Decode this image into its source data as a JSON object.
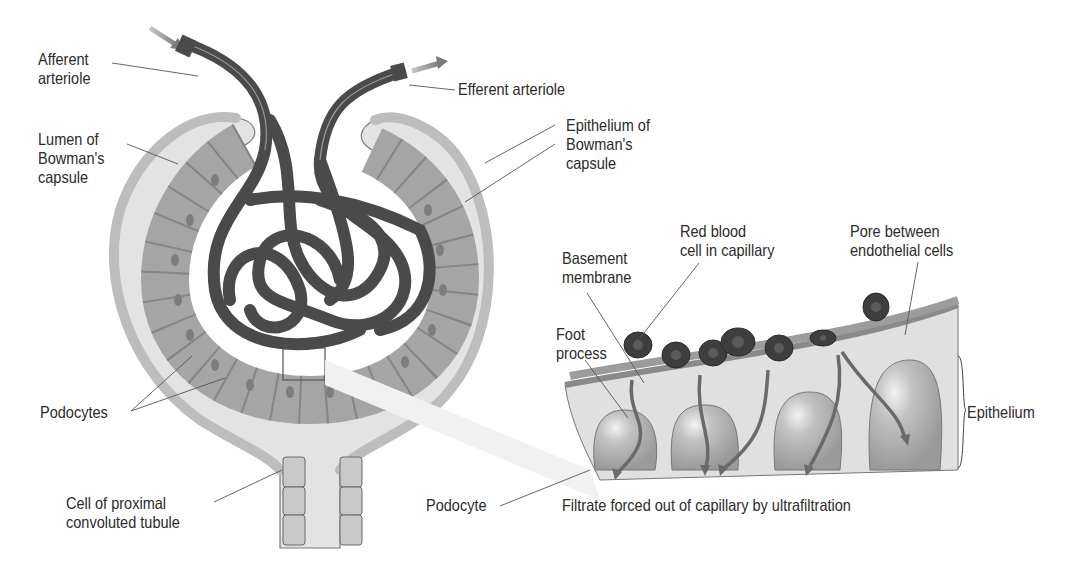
{
  "diagram": {
    "labels": {
      "afferent": "Afferent\narteriole",
      "efferent": "Efferent arteriole",
      "lumen": "Lumen of\nBowman's\ncapsule",
      "epithelium_bowman": "Epithelium of\nBowman's\ncapsule",
      "podocytes": "Podocytes",
      "proximal": "Cell of proximal\nconvoluted tubule",
      "basement": "Basement\nmembrane",
      "rbc": "Red blood\ncell in capillary",
      "pore": "Pore between\nendothelial cells",
      "foot": "Foot\nprocess",
      "epithelium": "Epithelium",
      "podocyte": "Podocyte",
      "filtrate": "Filtrate forced out of capillary by ultrafiltration"
    },
    "colors": {
      "vessel": "#4a4a4a",
      "capsule_wall": "#c4c4c4",
      "lumen_fill": "#e2e2e2",
      "cell_fill": "#a9a9a9",
      "nucleus": "#7a7a7a",
      "rbc": "#3e3e3e",
      "arrow": "#8a8a8a"
    }
  }
}
